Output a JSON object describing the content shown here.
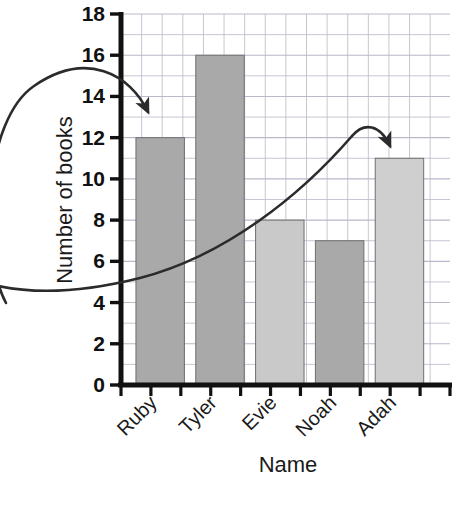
{
  "chart_data": {
    "type": "bar",
    "title": "",
    "subtitle": "",
    "xlabel": "Name",
    "ylabel": "Number of books",
    "categories": [
      "Ruby",
      "Tyler",
      "Evie",
      "Noah",
      "Adah"
    ],
    "values": [
      12,
      16,
      8,
      7,
      11
    ],
    "bar_colors": [
      "#a9a9a9",
      "#a9a9a9",
      "#c9c9c9",
      "#a9a9a9",
      "#cfcfcf"
    ],
    "ylim": [
      0,
      18
    ],
    "ytick_step": 2,
    "yticks": [
      "0",
      "2",
      "4",
      "6",
      "8",
      "10",
      "12",
      "14",
      "16",
      "18"
    ],
    "minor_gridline_step": 1,
    "grid": true,
    "grid_color": "#b9b9c9",
    "legend": "none",
    "axis_color": "#111111",
    "xtick_rotation_degrees": -45
  },
  "annotations": {
    "arrow_left": {
      "name": "curved-arrow-to-ruby",
      "target_category": "Ruby",
      "target_value": 12,
      "color": "#2b2b2b"
    },
    "arrow_right": {
      "name": "curved-arrow-to-adah",
      "target_category": "Adah",
      "target_value": 11,
      "color": "#2b2b2b"
    }
  }
}
